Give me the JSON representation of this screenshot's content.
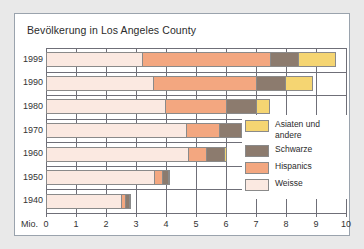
{
  "title": "Bevölkerung in Los Angeles County",
  "axis": {
    "unit_label": "Mio.",
    "xticks": [
      "0",
      "1",
      "2",
      "3",
      "4",
      "5",
      "6",
      "7",
      "8",
      "9",
      "10"
    ],
    "xmin": 0,
    "xmax": 10
  },
  "legend": {
    "items": [
      {
        "label": "Asiaten und andere",
        "color": "#F5D572"
      },
      {
        "label": "Schwarze",
        "color": "#8C7B6E"
      },
      {
        "label": "Hispanics",
        "color": "#F3A780"
      },
      {
        "label": "Weisse",
        "color": "#FBE9E1"
      }
    ]
  },
  "chart_data": {
    "type": "bar",
    "orientation": "horizontal",
    "stacked": true,
    "title": "Bevölkerung in Los Angeles County",
    "xlabel": "Mio.",
    "ylabel": "",
    "xlim": [
      0,
      10
    ],
    "grid": true,
    "legend_position": "right",
    "categories": [
      "1999",
      "1990",
      "1980",
      "1970",
      "1960",
      "1950",
      "1940"
    ],
    "series": [
      {
        "name": "Weisse",
        "color": "#FBE9E1",
        "values": [
          3.2,
          3.55,
          3.95,
          4.65,
          4.72,
          3.6,
          2.5
        ]
      },
      {
        "name": "Hispanics",
        "color": "#F3A780",
        "values": [
          4.25,
          3.45,
          2.05,
          1.1,
          0.63,
          0.25,
          0.13
        ]
      },
      {
        "name": "Schwarze",
        "color": "#8C7B6E",
        "values": [
          0.95,
          0.95,
          1.0,
          0.75,
          0.6,
          0.23,
          0.15
        ]
      },
      {
        "name": "Asiaten und andere",
        "color": "#F5D572",
        "values": [
          1.25,
          0.95,
          0.45,
          0.12,
          0.1,
          0.07,
          0.04
        ]
      }
    ],
    "totals": [
      9.65,
      8.9,
      7.45,
      6.62,
      6.05,
      4.15,
      2.82
    ]
  }
}
